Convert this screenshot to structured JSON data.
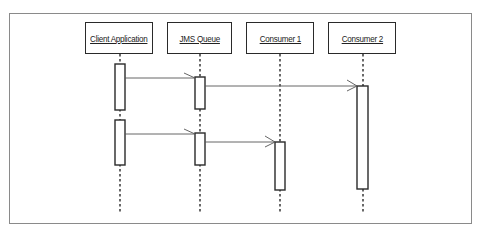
{
  "diagram": {
    "type": "sequence-diagram",
    "participants": [
      {
        "id": "client",
        "label": "Client Application"
      },
      {
        "id": "queue",
        "label": "JMS Queue"
      },
      {
        "id": "consumer1",
        "label": "Consumer 1"
      },
      {
        "id": "consumer2",
        "label": "Consumer 2"
      }
    ],
    "messages": [
      {
        "from": "Client Application",
        "to": "JMS Queue",
        "style": "async-open-arrow"
      },
      {
        "from": "JMS Queue",
        "to": "Consumer 2",
        "style": "async-open-arrow"
      },
      {
        "from": "Client Application",
        "to": "JMS Queue",
        "style": "async-open-arrow"
      },
      {
        "from": "JMS Queue",
        "to": "Consumer 1",
        "style": "async-open-arrow"
      }
    ],
    "colors": {
      "line": "#2a2a2a",
      "frame": "#8a8a8a",
      "background": "#ffffff"
    }
  }
}
